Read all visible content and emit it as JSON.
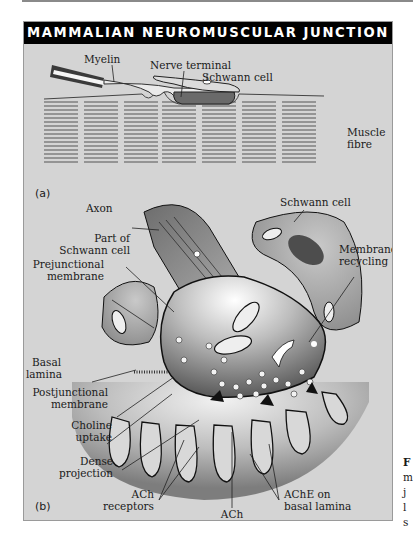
{
  "figure": {
    "title": "MAMMALIAN NEUROMUSCULAR JUNCTION",
    "panel_a": {
      "tag": "(a)",
      "labels": {
        "myelin": "Myelin",
        "nerve_terminal": "Nerve terminal",
        "schwann_cell": "Schwann cell",
        "muscle_fibre_1": "Muscle",
        "muscle_fibre_2": "fibre"
      }
    },
    "panel_b": {
      "tag": "(b)",
      "labels": {
        "axon": "Axon",
        "schwann_cell": "Schwann cell",
        "part_of_schwann_1": "Part of",
        "part_of_schwann_2": "Schwann cell",
        "membrane_recycling_1": "Membrane",
        "membrane_recycling_2": "recycling",
        "prejunctional_1": "Prejunctional",
        "prejunctional_2": "membrane",
        "basal_lamina_1": "Basal",
        "basal_lamina_2": "lamina",
        "postjunctional_1": "Postjunctional",
        "postjunctional_2": "membrane",
        "choline_uptake_1": "Choline",
        "choline_uptake_2": "uptake",
        "dense_projection_1": "Dense",
        "dense_projection_2": "projection",
        "ach_receptors_1": "ACh",
        "ach_receptors_2": "receptors",
        "ach": "ACh",
        "ache_1": "AChE on",
        "ache_2": "basal lamina"
      }
    },
    "caption_fragment": {
      "lines": [
        "F",
        "m",
        "j",
        "l",
        "s"
      ]
    },
    "colors": {
      "panel_bg": "#d4d4d4",
      "title_bg": "#000000",
      "title_fg": "#ffffff",
      "muscle_dark": "#8c8c8c",
      "terminal_dark": "#555555"
    }
  }
}
